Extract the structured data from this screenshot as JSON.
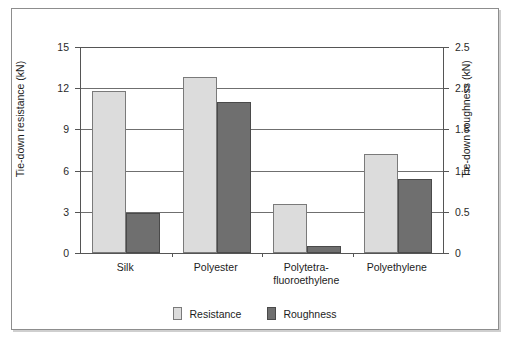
{
  "chart_data": {
    "type": "bar",
    "title": "",
    "xlabel": "",
    "categories": [
      "Silk",
      "Polyester",
      "Polytetra-\nfluoroethylene",
      "Polyethylene"
    ],
    "series": [
      {
        "name": "Resistance",
        "axis": "left",
        "color": "#dcdcdc",
        "values": [
          11.8,
          12.8,
          3.6,
          7.2
        ]
      },
      {
        "name": "Roughness",
        "axis": "right",
        "color": "#6f6f6f",
        "values": [
          0.48,
          1.83,
          0.09,
          0.9
        ]
      }
    ],
    "left_axis": {
      "label": "Tie-down resistance (kN)",
      "ticks": [
        "0",
        "3",
        "6",
        "9",
        "12",
        "15"
      ],
      "ylim": [
        0,
        15
      ],
      "unit": "kN"
    },
    "right_axis": {
      "label": "Tie-down roughness (kN)",
      "ticks": [
        "0",
        "0.5",
        "1.0",
        "1.5",
        "2.0",
        "2.5"
      ],
      "ylim": [
        0,
        2.5
      ],
      "unit": "kN"
    },
    "grid": true,
    "legend_position": "bottom-center",
    "legend": [
      "Resistance",
      "Roughness"
    ]
  }
}
